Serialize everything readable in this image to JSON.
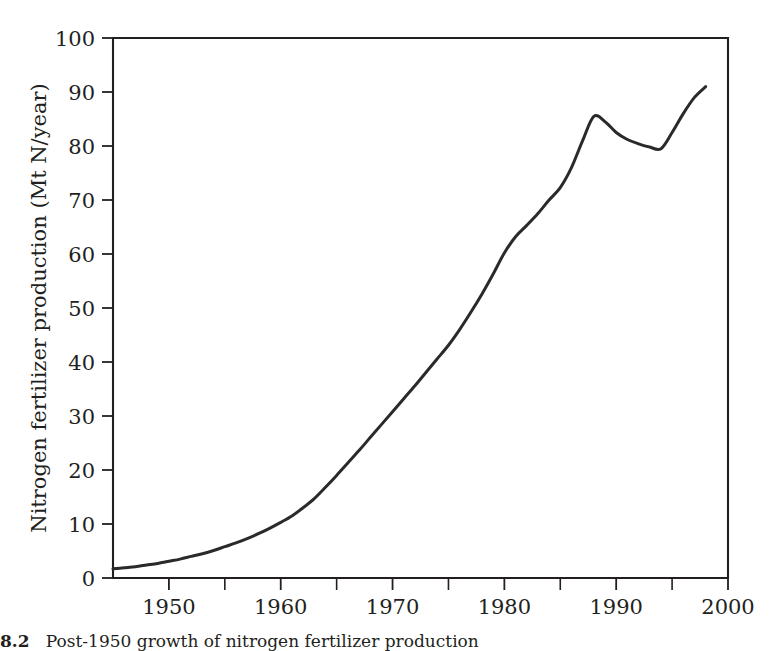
{
  "figure": {
    "caption_number": "8.2",
    "caption_text": "Post-1950 growth of nitrogen fertilizer production",
    "line_color": "#2b2a2a",
    "axis_color": "#231f20",
    "background_color": "#ffffff"
  },
  "chart_data": {
    "type": "line",
    "title": "",
    "xlabel": "",
    "ylabel": "Nitrogen fertilizer production (Mt N/year)",
    "xlim": [
      1945,
      2000
    ],
    "ylim": [
      0,
      100
    ],
    "grid": false,
    "legend": "none",
    "x_tick_labels": [
      "1950",
      "1960",
      "1970",
      "1980",
      "1990",
      "2000"
    ],
    "x_tick_values": [
      1950,
      1960,
      1970,
      1980,
      1990,
      2000
    ],
    "x_minor_tick_values": [
      1945,
      1955,
      1965,
      1975,
      1985,
      1995
    ],
    "y_tick_labels": [
      "0",
      "10",
      "20",
      "30",
      "40",
      "50",
      "60",
      "70",
      "80",
      "90",
      "100"
    ],
    "y_tick_values": [
      0,
      10,
      20,
      30,
      40,
      50,
      60,
      70,
      80,
      90,
      100
    ],
    "series": [
      {
        "name": "Nitrogen fertilizer production",
        "x": [
          1945,
          1946,
          1947,
          1948,
          1949,
          1950,
          1951,
          1952,
          1953,
          1954,
          1955,
          1956,
          1957,
          1958,
          1959,
          1960,
          1961,
          1962,
          1963,
          1964,
          1965,
          1966,
          1967,
          1968,
          1969,
          1970,
          1971,
          1972,
          1973,
          1974,
          1975,
          1976,
          1977,
          1978,
          1979,
          1980,
          1981,
          1982,
          1983,
          1984,
          1985,
          1986,
          1987,
          1988,
          1989,
          1990,
          1991,
          1992,
          1993,
          1994,
          1995,
          1996,
          1997,
          1998
        ],
        "values": [
          1.7,
          1.9,
          2.1,
          2.4,
          2.7,
          3.1,
          3.5,
          4.0,
          4.5,
          5.1,
          5.8,
          6.5,
          7.3,
          8.2,
          9.2,
          10.3,
          11.5,
          13.0,
          14.7,
          16.8,
          19.0,
          21.3,
          23.6,
          26.0,
          28.4,
          30.8,
          33.2,
          35.6,
          38.1,
          40.6,
          43.1,
          46.0,
          49.2,
          52.6,
          56.3,
          60.2,
          63.2,
          65.3,
          67.5,
          70.0,
          72.3,
          76.0,
          81.0,
          85.5,
          84.5,
          82.5,
          81.2,
          80.4,
          79.8,
          79.5,
          82.5,
          86.0,
          89.0,
          91.0
        ]
      }
    ],
    "annotations": {
      "start_point": {
        "x": 1945,
        "y": 1.7
      },
      "peak_point": {
        "x": 1988,
        "y": 85.5
      },
      "trough_point": {
        "x": 1994,
        "y": 79.5
      },
      "end_point": {
        "x": 1998,
        "y": 91.0
      }
    }
  }
}
